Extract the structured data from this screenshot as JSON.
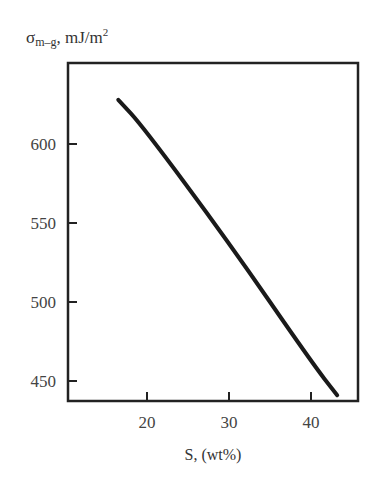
{
  "chart_data": {
    "type": "line",
    "title": "",
    "xlabel": "S, (wt%)",
    "ylabel": "σm–g, mJ/m2",
    "ylabel_parts": {
      "symbol": "σ",
      "subscript": "m–g",
      "unit": ", mJ/m",
      "superscript": "2"
    },
    "xlim": [
      11.5,
      45.3
    ],
    "ylim": [
      428,
      680
    ],
    "x_ticks": [
      20,
      30,
      40
    ],
    "y_ticks": [
      450,
      500,
      550,
      600
    ],
    "grid": false,
    "legend": null,
    "series": [
      {
        "name": "σm-g vs S",
        "x": [
          16.5,
          19.5,
          29.8,
          40.2,
          43.2
        ],
        "y": [
          628,
          611,
          539,
          461,
          441
        ]
      }
    ]
  }
}
